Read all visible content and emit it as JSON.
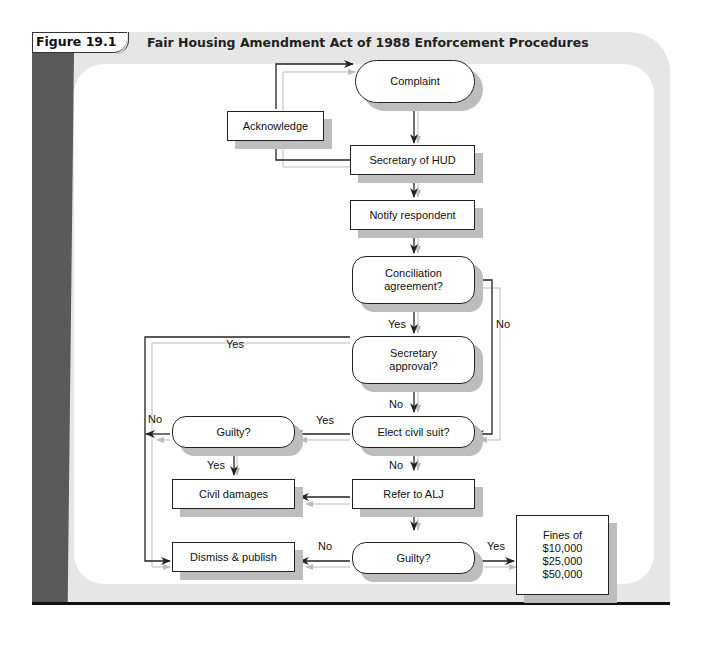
{
  "figure": {
    "number": "Figure 19.1",
    "title": "Fair Housing Amendment Act of 1988 Enforcement Procedures"
  },
  "nodes": {
    "complaint": "Complaint",
    "acknowledge": "Acknowledge",
    "secretary_hud": "Secretary of HUD",
    "notify_respondent": "Notify respondent",
    "conciliation": "Conciliation\nagreement?",
    "secretary_approval": "Secretary\napproval?",
    "elect_civil_suit": "Elect civil suit?",
    "guilty_civil": "Guilty?",
    "civil_damages": "Civil damages",
    "refer_alj": "Refer to ALJ",
    "guilty_alj": "Guilty?",
    "dismiss_publish": "Dismiss & publish",
    "fines": "Fines of\n$10,000\n$25,000\n$50,000"
  },
  "edge_labels": {
    "conciliation_yes": "Yes",
    "conciliation_no": "No",
    "approval_yes": "Yes",
    "approval_no": "No",
    "civil_suit_yes": "Yes",
    "civil_suit_no": "No",
    "guilty_civil_no": "No",
    "guilty_civil_yes": "Yes",
    "guilty_alj_no": "No",
    "guilty_alj_yes": "Yes"
  },
  "colors": {
    "line": "#222222",
    "shadow_line": "#bbbbbb",
    "node_shadow": "#bdbdbd",
    "panel": "#e6e6e6",
    "strip": "#5a5a5a"
  }
}
